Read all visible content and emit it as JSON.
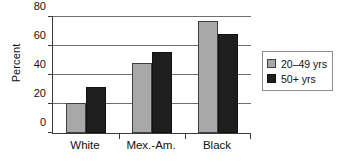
{
  "chart_data": {
    "type": "bar",
    "title": "",
    "xlabel": "",
    "ylabel": "Percent",
    "categories": [
      "White",
      "Mex.-Am.",
      "Black"
    ],
    "series": [
      {
        "name": "20–49 yrs",
        "values": [
          21,
          48,
          77
        ],
        "color": "#a8a8a8"
      },
      {
        "name": "50+ yrs",
        "values": [
          32,
          56,
          68
        ],
        "color": "#1e1e1e"
      }
    ],
    "ylim": [
      0,
      80
    ],
    "yticks": [
      0,
      20,
      40,
      60,
      80
    ],
    "ytick_labels": [
      "0",
      "20",
      "40",
      "60",
      "80"
    ],
    "grid": true,
    "grid_axis": "y",
    "legend_position": "right"
  },
  "legend": {
    "items": [
      {
        "label": "20–49 yrs",
        "swatch": "legend-swatch-gray"
      },
      {
        "label": "50+ yrs",
        "swatch": "legend-swatch-black"
      }
    ]
  },
  "colors": {
    "series_1": "#a8a8a8",
    "series_2": "#1e1e1e",
    "axis": "#3a3a3a",
    "grid": "#6e6e6e",
    "background": "#ffffff"
  }
}
